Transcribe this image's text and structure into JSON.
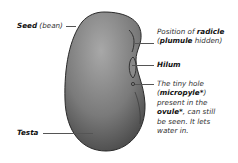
{
  "diagram": {
    "colors": {
      "seed_light": "#9a9a9a",
      "seed_dark": "#3a3a3a",
      "outline": "#2a2a2a",
      "leader_line": "#555555"
    },
    "labels": {
      "seed": {
        "bold": "Seed",
        "normal": " (bean)"
      },
      "testa": {
        "bold": "Testa"
      },
      "radicle": {
        "line1_normal": "Position of ",
        "line1_bold": "radicle",
        "line2_open": "(",
        "line2_bold": "plumule",
        "line2_normal": " hidden)"
      },
      "hilum": {
        "bold": "Hilum"
      },
      "micropyle": {
        "line1": "The tiny hole",
        "line2_open": "(",
        "line2_bold": "micropyle*",
        "line2_close": ")",
        "line3": "present in the",
        "line4_bold": "ovule*",
        "line4_normal": ", can still",
        "line5": "be seen. It lets",
        "line6": "water in."
      }
    }
  }
}
